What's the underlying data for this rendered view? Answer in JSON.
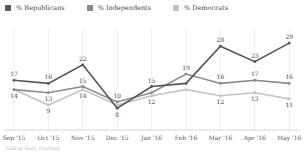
{
  "legend": [
    {
      "label": "% Republicans",
      "color": "#555555"
    },
    {
      "label": "% Independents",
      "color": "#8a8a8a"
    },
    {
      "label": "% Democrats",
      "color": "#c4c4c4"
    }
  ],
  "footer": "Gallup Daily tracking",
  "chart_data": {
    "type": "line",
    "title": "",
    "xlabel": "",
    "ylabel": "",
    "categories": [
      "Sep '15",
      "Oct '15",
      "Nov '15",
      "Dec '15",
      "Jan '16",
      "Feb '16",
      "Mar '16",
      "Apr '16",
      "May '16"
    ],
    "series": [
      {
        "name": "% Republicans",
        "color": "#555555",
        "values": [
          17,
          16,
          22,
          8,
          15,
          16,
          28,
          23,
          29
        ],
        "labels": [
          17,
          16,
          22,
          8,
          15,
          null,
          28,
          23,
          29
        ]
      },
      {
        "name": "% Independents",
        "color": "#8a8a8a",
        "values": [
          14,
          13,
          15,
          10,
          13,
          19,
          16,
          17,
          16
        ],
        "labels": [
          null,
          13,
          15,
          10,
          null,
          19,
          16,
          17,
          16
        ]
      },
      {
        "name": "% Democrats",
        "color": "#c4c4c4",
        "values": [
          14,
          9,
          14,
          9,
          12,
          14,
          12,
          13,
          11
        ],
        "labels": [
          14,
          9,
          14,
          null,
          12,
          null,
          12,
          13,
          11
        ]
      }
    ],
    "grid": "vertical",
    "legend_position": "top-left",
    "ylim": [
      0,
      32
    ]
  }
}
